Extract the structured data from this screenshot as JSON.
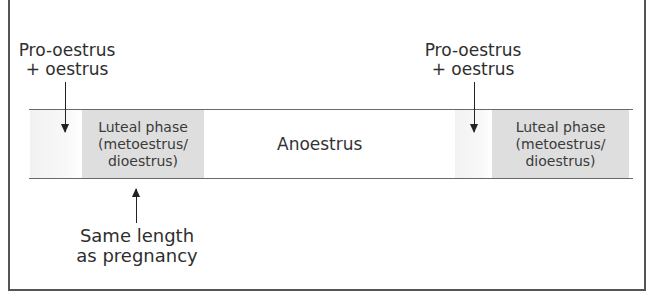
{
  "diagram": {
    "title": "",
    "timeline_labels": {
      "anoestrus": "Anoestrus"
    },
    "phases": [
      {
        "id": "pro-oestrus-1",
        "type": "pro-oestrus-oestrus",
        "color": "#f4f4f4"
      },
      {
        "id": "luteal-1",
        "type": "luteal",
        "line1": "Luteal phase",
        "line2": "(metoestrus/",
        "line3": "dioestrus)",
        "color": "#dedede"
      },
      {
        "id": "anoestrus",
        "type": "anoestrus",
        "label": "Anoestrus"
      },
      {
        "id": "pro-oestrus-2",
        "type": "pro-oestrus-oestrus",
        "color": "#f4f4f4"
      },
      {
        "id": "luteal-2",
        "type": "luteal",
        "line1": "Luteal phase",
        "line2": "(metoestrus/",
        "line3": "dioestrus)",
        "color": "#dedede"
      }
    ],
    "annotations": [
      {
        "id": "pro-oestrus-label-1",
        "line1": "Pro-oestrus",
        "line2": "+ oestrus",
        "arrow": "down"
      },
      {
        "id": "pro-oestrus-label-2",
        "line1": "Pro-oestrus",
        "line2": "+ oestrus",
        "arrow": "down"
      },
      {
        "id": "pregnancy-note",
        "line1": "Same length",
        "line2": "as pregnancy",
        "arrow": "up"
      }
    ]
  },
  "colors": {
    "frame": "#555555",
    "timeline_line": "#6a6a6a",
    "luteal_band": "#dedede",
    "pro_band": "#f4f4f4",
    "text": "#333333",
    "arrow": "#222222"
  }
}
